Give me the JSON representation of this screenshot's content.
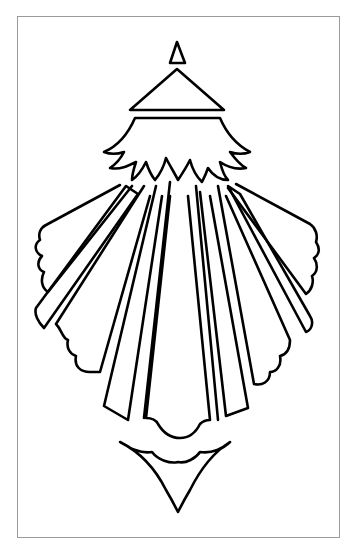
{
  "artwork": {
    "title": "Ornamental line drawing",
    "description": "Black outline drawing of a stylized radiating fan/lantern ornament with a small triangle finial, a triangular roof, a jagged leaf crown, radiating rays with scalloped edges, and a pointed pendant below, inside a thin grey frame",
    "colors": {
      "stroke": "#000000",
      "background": "#ffffff",
      "frame": "#9a9a9a"
    },
    "parts": [
      "finial-triangle",
      "roof-triangle",
      "leaf-crown",
      "left-wing-rays",
      "right-wing-rays",
      "center-rays",
      "scalloped-bottom",
      "pendant-drop"
    ]
  }
}
